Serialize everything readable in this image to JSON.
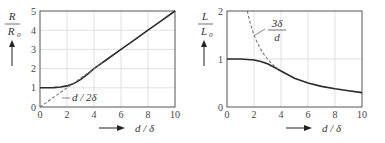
{
  "chart_data": [
    {
      "type": "line",
      "title": "",
      "ylabel": "R / R0",
      "ylabel_parts": {
        "num": "R",
        "den": "R",
        "den_sub": "0"
      },
      "xlabel": "d / δ",
      "xlim": [
        0,
        10
      ],
      "ylim": [
        0,
        5
      ],
      "xticks": [
        "0",
        "2",
        "4",
        "6",
        "8",
        "10"
      ],
      "yticks": [
        "0",
        "1",
        "2",
        "3",
        "4",
        "5"
      ],
      "grid": true,
      "series": [
        {
          "name": "R/R0 (exact)",
          "style": "solid",
          "x": [
            0,
            0.5,
            1,
            1.5,
            2,
            2.5,
            3,
            3.5,
            4,
            5,
            6,
            7,
            8,
            9,
            10
          ],
          "y": [
            1.0,
            1.0,
            1.01,
            1.04,
            1.1,
            1.22,
            1.42,
            1.7,
            2.0,
            2.5,
            3.0,
            3.5,
            4.0,
            4.5,
            5.0
          ]
        },
        {
          "name": "d / 2δ",
          "style": "dashed",
          "x": [
            0,
            1,
            2,
            3,
            4,
            4.6
          ],
          "y": [
            0,
            0.5,
            1.0,
            1.5,
            2.0,
            2.3
          ]
        }
      ],
      "annotations": [
        {
          "text": "d / 2δ",
          "x": 3.0,
          "y": 0.6
        }
      ]
    },
    {
      "type": "line",
      "title": "",
      "ylabel": "L / L0",
      "ylabel_parts": {
        "num": "L",
        "den": "L",
        "den_sub": "0"
      },
      "xlabel": "d / δ",
      "xlim": [
        0,
        10
      ],
      "ylim": [
        0,
        2
      ],
      "xticks": [
        "0",
        "2",
        "4",
        "6",
        "8",
        "10"
      ],
      "yticks": [
        "0",
        "1",
        "2"
      ],
      "grid": true,
      "series": [
        {
          "name": "L/L0 (exact)",
          "style": "solid",
          "x": [
            0,
            1,
            2,
            2.5,
            3,
            3.5,
            4,
            5,
            6,
            7,
            8,
            9,
            10
          ],
          "y": [
            1.0,
            1.0,
            0.98,
            0.95,
            0.9,
            0.83,
            0.75,
            0.6,
            0.5,
            0.43,
            0.38,
            0.34,
            0.3
          ]
        },
        {
          "name": "3δ / d",
          "style": "dashed",
          "x": [
            1.5,
            1.75,
            2,
            2.25,
            2.5,
            2.75,
            3,
            3.25,
            3.5,
            3.75
          ],
          "y": [
            2.0,
            1.714,
            1.5,
            1.333,
            1.2,
            1.091,
            1.0,
            0.923,
            0.857,
            0.8
          ]
        }
      ],
      "annotations": [
        {
          "text_num": "3δ",
          "text_den": "d",
          "x": 3.8,
          "y": 1.6
        }
      ]
    }
  ],
  "labels": {
    "left_y_num": "R",
    "left_y_den": "R",
    "left_y_sub": "0",
    "right_y_num": "L",
    "right_y_den": "L",
    "right_y_sub": "0",
    "x_label": "d / δ",
    "left_annotation": "d / 2δ",
    "right_annotation_num": "3δ",
    "right_annotation_den": "d"
  }
}
